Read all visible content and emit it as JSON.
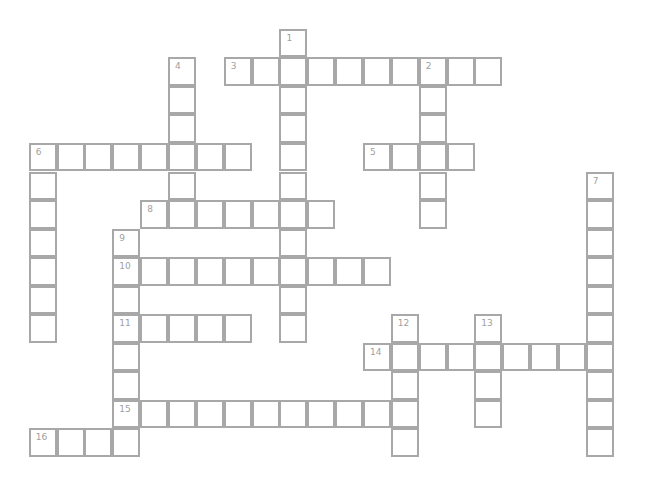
{
  "puzzle": {
    "type": "crossword",
    "grid_origin": {
      "x": 30,
      "y": 30
    },
    "cell_pitch": {
      "x": 27.85,
      "y": 28.55
    },
    "colors": {
      "border": "#a8a8a8",
      "number": "#a0a0a0",
      "background": "#ffffff"
    },
    "entries": [
      {
        "number": "1",
        "direction": "down",
        "row": 0,
        "col": 9,
        "length": 11
      },
      {
        "number": "2",
        "direction": "down",
        "row": 1,
        "col": 14,
        "length": 6
      },
      {
        "number": "3",
        "direction": "across",
        "row": 1,
        "col": 7,
        "length": 10
      },
      {
        "number": "4",
        "direction": "down",
        "row": 1,
        "col": 5,
        "length": 6
      },
      {
        "number": "5",
        "direction": "across",
        "row": 4,
        "col": 12,
        "length": 4
      },
      {
        "number": "6",
        "direction": "across",
        "row": 4,
        "col": 0,
        "length": 8
      },
      {
        "number": "6",
        "direction": "down",
        "row": 4,
        "col": 0,
        "length": 7
      },
      {
        "number": "7",
        "direction": "down",
        "row": 5,
        "col": 20,
        "length": 10
      },
      {
        "number": "8",
        "direction": "across",
        "row": 6,
        "col": 4,
        "length": 7
      },
      {
        "number": "9",
        "direction": "down",
        "row": 7,
        "col": 3,
        "length": 8
      },
      {
        "number": "10",
        "direction": "across",
        "row": 8,
        "col": 3,
        "length": 10
      },
      {
        "number": "11",
        "direction": "across",
        "row": 10,
        "col": 3,
        "length": 5
      },
      {
        "number": "12",
        "direction": "down",
        "row": 10,
        "col": 13,
        "length": 5
      },
      {
        "number": "13",
        "direction": "down",
        "row": 10,
        "col": 16,
        "length": 4
      },
      {
        "number": "14",
        "direction": "across",
        "row": 11,
        "col": 12,
        "length": 9
      },
      {
        "number": "15",
        "direction": "across",
        "row": 13,
        "col": 3,
        "length": 11
      },
      {
        "number": "16",
        "direction": "across",
        "row": 14,
        "col": 0,
        "length": 4
      }
    ]
  }
}
